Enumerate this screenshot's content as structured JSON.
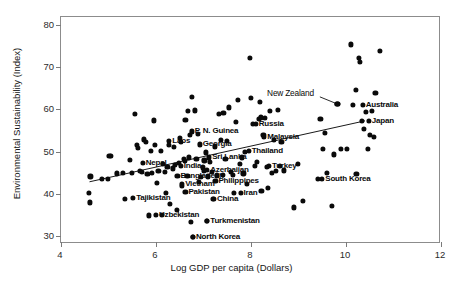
{
  "chart_data": {
    "type": "scatter",
    "title": "",
    "xlabel": "Log GDP per capita (Dollars)",
    "ylabel": "Environmental Sustainability (Index)",
    "xlim": [
      4,
      12
    ],
    "ylim": [
      28,
      82
    ],
    "xticks": [
      4,
      6,
      8,
      10,
      12
    ],
    "yticks": [
      30,
      40,
      50,
      60,
      70,
      80
    ],
    "grid": false,
    "legend": null,
    "marker_color": "#0a0a0a",
    "trendline": {
      "visible": true,
      "x": [
        4.6,
        10.4
      ],
      "y": [
        42.8,
        57.3
      ]
    },
    "annotations": [
      {
        "label": "P. N. Guinea",
        "x": 6.75,
        "y": 54.8,
        "align": "right"
      },
      {
        "label": "Laos",
        "x": 6.28,
        "y": 52.6,
        "align": "right"
      },
      {
        "label": "Georgia",
        "x": 6.92,
        "y": 51.7,
        "align": "right"
      },
      {
        "label": "Nepal",
        "x": 5.72,
        "y": 47.3,
        "align": "right"
      },
      {
        "label": "India",
        "x": 6.52,
        "y": 46.5,
        "align": "right"
      },
      {
        "label": "Sri Lanka",
        "x": 7.12,
        "y": 48.6,
        "align": "right"
      },
      {
        "label": "Azerbaijan",
        "x": 7.08,
        "y": 45.6,
        "align": "right"
      },
      {
        "label": "Bangladesh",
        "x": 6.45,
        "y": 44.2,
        "align": "right"
      },
      {
        "label": "Vietnam",
        "x": 6.55,
        "y": 42.3,
        "align": "right"
      },
      {
        "label": "Philippines",
        "x": 7.25,
        "y": 43.0,
        "align": "right"
      },
      {
        "label": "Pakistan",
        "x": 6.62,
        "y": 40.4,
        "align": "right"
      },
      {
        "label": "China",
        "x": 7.22,
        "y": 38.8,
        "align": "right"
      },
      {
        "label": "Iran",
        "x": 7.78,
        "y": 40.1,
        "align": "right"
      },
      {
        "label": "Tajikistan",
        "x": 5.52,
        "y": 38.9,
        "align": "right"
      },
      {
        "label": "Uzbekistan",
        "x": 6.0,
        "y": 34.9,
        "align": "right"
      },
      {
        "label": "Turkmenistan",
        "x": 7.08,
        "y": 33.4,
        "align": "right"
      },
      {
        "label": "North Korea",
        "x": 6.78,
        "y": 29.6,
        "align": "right"
      },
      {
        "label": "Thailand",
        "x": 7.95,
        "y": 50.2,
        "align": "right"
      },
      {
        "label": "Turkey",
        "x": 8.38,
        "y": 46.6,
        "align": "right"
      },
      {
        "label": "Malaysia",
        "x": 8.28,
        "y": 53.4,
        "align": "right"
      },
      {
        "label": "Russia",
        "x": 8.1,
        "y": 56.5,
        "align": "right"
      },
      {
        "label": "South Korea",
        "x": 9.5,
        "y": 43.5,
        "align": "right"
      },
      {
        "label": "Australia",
        "x": 10.35,
        "y": 61.0,
        "align": "right"
      },
      {
        "label": "Japan",
        "x": 10.48,
        "y": 57.3,
        "align": "right"
      },
      {
        "label": "New Zealand",
        "x": 9.28,
        "y": 63.6,
        "align": "left",
        "style": "plain",
        "leader": {
          "x1": 9.45,
          "y1": 63.0,
          "x2": 9.82,
          "y2": 61.3
        }
      }
    ],
    "points": [
      {
        "x": 4.58,
        "y": 40.1
      },
      {
        "x": 4.6,
        "y": 37.9
      },
      {
        "x": 4.62,
        "y": 44.1
      },
      {
        "x": 4.86,
        "y": 43.4
      },
      {
        "x": 4.98,
        "y": 43.4
      },
      {
        "x": 5.02,
        "y": 48.9
      },
      {
        "x": 5.05,
        "y": 49.0
      },
      {
        "x": 5.18,
        "y": 44.8
      },
      {
        "x": 5.3,
        "y": 44.9
      },
      {
        "x": 5.35,
        "y": 38.8
      },
      {
        "x": 5.45,
        "y": 48.0
      },
      {
        "x": 5.5,
        "y": 44.9
      },
      {
        "x": 5.56,
        "y": 58.9
      },
      {
        "x": 5.6,
        "y": 51.5
      },
      {
        "x": 5.62,
        "y": 50.8
      },
      {
        "x": 5.66,
        "y": 45.3
      },
      {
        "x": 5.7,
        "y": 45.1
      },
      {
        "x": 5.74,
        "y": 52.9
      },
      {
        "x": 5.78,
        "y": 52.3
      },
      {
        "x": 5.82,
        "y": 44.6
      },
      {
        "x": 5.85,
        "y": 34.8
      },
      {
        "x": 5.9,
        "y": 50.1
      },
      {
        "x": 5.92,
        "y": 45.0
      },
      {
        "x": 5.95,
        "y": 57.4
      },
      {
        "x": 5.98,
        "y": 51.5
      },
      {
        "x": 6.02,
        "y": 42.5
      },
      {
        "x": 6.05,
        "y": 45.4
      },
      {
        "x": 6.1,
        "y": 50.1
      },
      {
        "x": 6.12,
        "y": 35.0
      },
      {
        "x": 6.15,
        "y": 47.1
      },
      {
        "x": 6.18,
        "y": 45.2
      },
      {
        "x": 6.2,
        "y": 40.1
      },
      {
        "x": 6.24,
        "y": 46.4
      },
      {
        "x": 6.28,
        "y": 51.6
      },
      {
        "x": 6.3,
        "y": 37.5
      },
      {
        "x": 6.35,
        "y": 46.0
      },
      {
        "x": 6.38,
        "y": 51.1
      },
      {
        "x": 6.4,
        "y": 46.9
      },
      {
        "x": 6.44,
        "y": 36.1
      },
      {
        "x": 6.48,
        "y": 47.2
      },
      {
        "x": 6.5,
        "y": 53.3
      },
      {
        "x": 6.52,
        "y": 52.2
      },
      {
        "x": 6.55,
        "y": 41.8
      },
      {
        "x": 6.58,
        "y": 48.3
      },
      {
        "x": 6.6,
        "y": 47.7
      },
      {
        "x": 6.62,
        "y": 57.5
      },
      {
        "x": 6.66,
        "y": 44.2
      },
      {
        "x": 6.68,
        "y": 59.7
      },
      {
        "x": 6.7,
        "y": 48.6
      },
      {
        "x": 6.72,
        "y": 53.9
      },
      {
        "x": 6.74,
        "y": 33.2
      },
      {
        "x": 6.76,
        "y": 63.0
      },
      {
        "x": 6.78,
        "y": 29.6
      },
      {
        "x": 6.82,
        "y": 59.8
      },
      {
        "x": 6.85,
        "y": 48.3
      },
      {
        "x": 6.88,
        "y": 54.2
      },
      {
        "x": 6.9,
        "y": 42.7
      },
      {
        "x": 6.94,
        "y": 44.0
      },
      {
        "x": 6.98,
        "y": 46.2
      },
      {
        "x": 7.0,
        "y": 45.3
      },
      {
        "x": 7.02,
        "y": 47.9
      },
      {
        "x": 7.05,
        "y": 49.8
      },
      {
        "x": 7.08,
        "y": 33.4
      },
      {
        "x": 7.1,
        "y": 44.1
      },
      {
        "x": 7.14,
        "y": 47.6
      },
      {
        "x": 7.18,
        "y": 45.2
      },
      {
        "x": 7.2,
        "y": 38.8
      },
      {
        "x": 7.24,
        "y": 51.2
      },
      {
        "x": 7.28,
        "y": 44.3
      },
      {
        "x": 7.32,
        "y": 59.0
      },
      {
        "x": 7.36,
        "y": 52.7
      },
      {
        "x": 7.4,
        "y": 44.4
      },
      {
        "x": 7.42,
        "y": 59.1
      },
      {
        "x": 7.46,
        "y": 48.2
      },
      {
        "x": 7.5,
        "y": 52.5
      },
      {
        "x": 7.54,
        "y": 60.5
      },
      {
        "x": 7.58,
        "y": 45.1
      },
      {
        "x": 7.62,
        "y": 44.5
      },
      {
        "x": 7.64,
        "y": 40.1
      },
      {
        "x": 7.68,
        "y": 57.0
      },
      {
        "x": 7.72,
        "y": 62.3
      },
      {
        "x": 7.76,
        "y": 47.0
      },
      {
        "x": 7.8,
        "y": 48.6
      },
      {
        "x": 7.84,
        "y": 44.8
      },
      {
        "x": 7.88,
        "y": 50.0
      },
      {
        "x": 7.92,
        "y": 42.3
      },
      {
        "x": 7.98,
        "y": 72.2
      },
      {
        "x": 8.0,
        "y": 62.8
      },
      {
        "x": 8.04,
        "y": 56.5
      },
      {
        "x": 8.08,
        "y": 46.5
      },
      {
        "x": 8.12,
        "y": 47.6
      },
      {
        "x": 8.16,
        "y": 57.8
      },
      {
        "x": 8.18,
        "y": 61.8
      },
      {
        "x": 8.2,
        "y": 58.1
      },
      {
        "x": 8.22,
        "y": 40.6
      },
      {
        "x": 8.26,
        "y": 54.0
      },
      {
        "x": 8.3,
        "y": 58.0
      },
      {
        "x": 8.34,
        "y": 46.3
      },
      {
        "x": 8.36,
        "y": 41.3
      },
      {
        "x": 8.4,
        "y": 59.6
      },
      {
        "x": 8.44,
        "y": 45.0
      },
      {
        "x": 8.48,
        "y": 52.7
      },
      {
        "x": 8.52,
        "y": 45.4
      },
      {
        "x": 8.56,
        "y": 59.9
      },
      {
        "x": 8.6,
        "y": 46.5
      },
      {
        "x": 8.64,
        "y": 52.3
      },
      {
        "x": 8.7,
        "y": 45.5
      },
      {
        "x": 8.9,
        "y": 36.7
      },
      {
        "x": 8.98,
        "y": 47.0
      },
      {
        "x": 9.1,
        "y": 38.2
      },
      {
        "x": 9.4,
        "y": 43.4
      },
      {
        "x": 9.46,
        "y": 57.8
      },
      {
        "x": 9.52,
        "y": 50.6
      },
      {
        "x": 9.56,
        "y": 54.5
      },
      {
        "x": 9.6,
        "y": 45.0
      },
      {
        "x": 9.7,
        "y": 37.0
      },
      {
        "x": 9.74,
        "y": 49.3
      },
      {
        "x": 9.82,
        "y": 61.3
      },
      {
        "x": 9.9,
        "y": 50.6
      },
      {
        "x": 10.02,
        "y": 50.7
      },
      {
        "x": 10.1,
        "y": 75.5
      },
      {
        "x": 10.14,
        "y": 61.0
      },
      {
        "x": 10.2,
        "y": 64.6
      },
      {
        "x": 10.22,
        "y": 44.7
      },
      {
        "x": 10.28,
        "y": 72.2
      },
      {
        "x": 10.3,
        "y": 71.4
      },
      {
        "x": 10.34,
        "y": 57.3
      },
      {
        "x": 10.38,
        "y": 55.4
      },
      {
        "x": 10.42,
        "y": 59.4
      },
      {
        "x": 10.46,
        "y": 50.6
      },
      {
        "x": 10.5,
        "y": 54.0
      },
      {
        "x": 10.54,
        "y": 59.6
      },
      {
        "x": 10.58,
        "y": 53.4
      },
      {
        "x": 10.62,
        "y": 64.0
      },
      {
        "x": 10.72,
        "y": 74.0
      }
    ]
  }
}
